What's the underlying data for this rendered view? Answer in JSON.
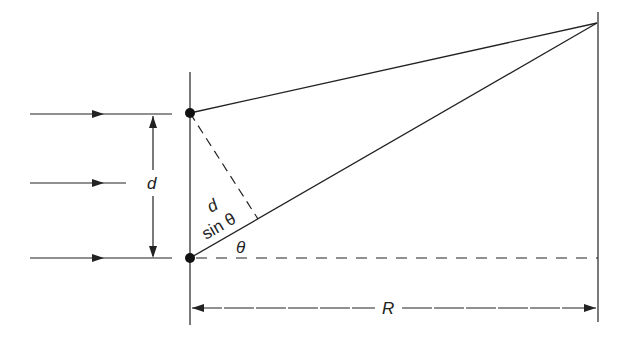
{
  "diagram": {
    "labels": {
      "slit_separation": "d",
      "path_difference_top": "d",
      "path_difference_bottom": "sin θ",
      "angle": "θ",
      "distance": "R"
    },
    "elements": {
      "incident_rays": 3,
      "slits": 2,
      "barrier": "vertical line with two slits",
      "screen": "vertical line at distance R"
    },
    "colors": {
      "ink": "#222222",
      "background": "#ffffff"
    }
  }
}
